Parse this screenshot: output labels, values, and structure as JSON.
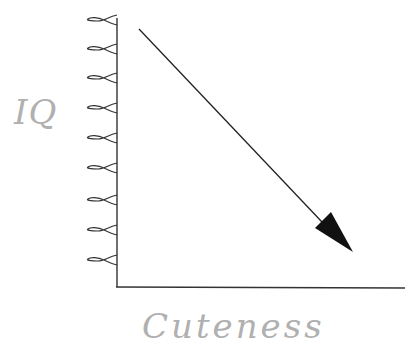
{
  "chart_data": {
    "type": "line",
    "title": "",
    "xlabel": "Cuteness",
    "ylabel": "IQ",
    "y_tick_count": 9,
    "x": [
      0,
      1
    ],
    "series": [
      {
        "name": "trend",
        "values": [
          1,
          0
        ]
      }
    ],
    "grid": false,
    "legend": null
  },
  "labels": {
    "y_axis": "IQ",
    "x_axis": "Cuteness"
  },
  "style": {
    "axis_color": "#333333",
    "label_color": "#b0b0b0",
    "arrow_color": "#111111"
  },
  "ticks_y": [
    20,
    49,
    78,
    108,
    138,
    168,
    200,
    230,
    260
  ]
}
